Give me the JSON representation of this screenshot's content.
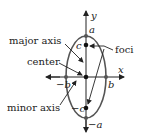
{
  "labels": {
    "y_axis": "y",
    "x_axis": "x",
    "a_top": "a",
    "a_bottom": "−a",
    "b_right": "b",
    "b_left": "−b",
    "c_top": "c",
    "c_bottom": "−c",
    "major_axis": "major axis",
    "center": "center",
    "minor_axis": "minor axis",
    "foci": "foci"
  },
  "colors": {
    "ellipse": "#555555",
    "axis": "#222222",
    "text": "#222222"
  }
}
